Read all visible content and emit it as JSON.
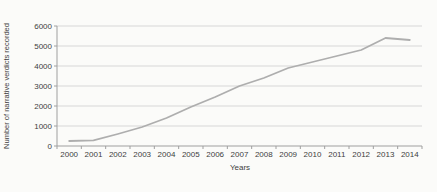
{
  "chart_data": {
    "type": "line",
    "title": "",
    "xlabel": "Years",
    "ylabel": "Number of narrative verdicts recorded",
    "categories": [
      "2000",
      "2001",
      "2002",
      "2003",
      "2004",
      "2005",
      "2006",
      "2007",
      "2008",
      "2009",
      "2010",
      "2011",
      "2012",
      "2013",
      "2014"
    ],
    "series": [
      {
        "name": "narrative-verdicts-recorded",
        "values": [
          250,
          280,
          600,
          950,
          1400,
          1950,
          2450,
          3000,
          3400,
          3900,
          4200,
          4500,
          4800,
          5400,
          5300
        ]
      }
    ],
    "ylim": [
      0,
      6000
    ],
    "ytick_step": 1000,
    "grid": "horizontal-only",
    "legend_position": "none",
    "colors": {
      "line": "#aeaeae",
      "grid": "#c9c9c9",
      "axis": "#9f9f9f",
      "text": "#3e3e3e",
      "background": "#fbfbf9"
    }
  }
}
